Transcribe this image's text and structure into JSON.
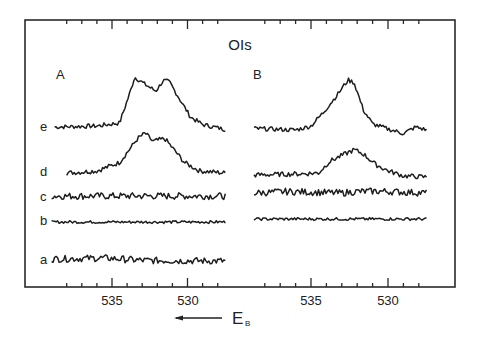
{
  "figure": {
    "title": "OIs",
    "x_axis_label": "E",
    "x_axis_label_subscript": "B",
    "x_axis_direction_note": "arrow pointing left (increasing binding energy)",
    "panels": [
      {
        "id": "A",
        "label": "A"
      },
      {
        "id": "B",
        "label": "B"
      }
    ],
    "curve_labels": [
      "e",
      "d",
      "c",
      "b",
      "a"
    ],
    "tick_labels": [
      "535",
      "530"
    ]
  },
  "colors": {
    "background": "#ffffff",
    "line": "#1e1e1e",
    "frame": "#2a2a2a"
  },
  "chart_data": [
    {
      "type": "line",
      "title": "OIs",
      "panel": "A",
      "xlabel": "E_B (binding energy, eV)",
      "ylabel": "",
      "xlim": [
        539,
        527.5
      ],
      "x_reversed": true,
      "x_ticks_major": [
        535,
        530
      ],
      "x_ticks_minor_step": 1,
      "grid": false,
      "legend": "none (curves labeled a-e at left)",
      "series": [
        {
          "name": "e",
          "baseline_y_px": 127,
          "x": [
            538.8,
            536,
            534.5,
            533.8,
            533.5,
            532.8,
            532.1,
            531.6,
            531.2,
            530.5,
            529.8,
            529,
            527.5
          ],
          "y": [
            0,
            0.02,
            0.08,
            0.7,
            1.0,
            0.85,
            0.72,
            0.93,
            0.9,
            0.55,
            0.2,
            0.05,
            -0.05
          ]
        },
        {
          "name": "d",
          "baseline_y_px": 173,
          "x": [
            538,
            536,
            534.5,
            533.3,
            532.8,
            532.3,
            531.5,
            531,
            530.2,
            529.2,
            527.5
          ],
          "y": [
            0,
            0.05,
            0.25,
            0.82,
            0.95,
            0.75,
            0.82,
            0.6,
            0.25,
            0.05,
            0
          ]
        },
        {
          "name": "c",
          "baseline_y_px": 196,
          "x": [
            539,
            527.5
          ],
          "y": [
            0,
            0
          ],
          "note": "noisy flat background"
        },
        {
          "name": "b",
          "baseline_y_px": 222,
          "x": [
            539,
            527.5
          ],
          "y": [
            0,
            0
          ],
          "note": "low-noise flat background"
        },
        {
          "name": "a",
          "baseline_y_px": 260,
          "x": [
            539,
            535.5,
            533,
            527.5
          ],
          "y": [
            0.05,
            0.1,
            -0.02,
            -0.05
          ],
          "note": "noisy, slightly higher on left"
        }
      ]
    },
    {
      "type": "line",
      "title": "OIs",
      "panel": "B",
      "xlabel": "E_B (binding energy, eV)",
      "ylabel": "",
      "xlim": [
        539,
        527.5
      ],
      "x_reversed": true,
      "x_ticks_major": [
        535,
        530
      ],
      "x_ticks_minor_step": 1,
      "grid": false,
      "legend": "none",
      "series": [
        {
          "name": "e",
          "baseline_y_px": 130,
          "x": [
            538.7,
            536,
            535,
            534.2,
            533.3,
            532.6,
            532.2,
            531.6,
            531,
            530,
            529,
            528.2,
            527.5
          ],
          "y": [
            0.03,
            0,
            0.08,
            0.35,
            0.7,
            1.0,
            0.95,
            0.4,
            0.12,
            0.02,
            -0.07,
            0.06,
            0
          ]
        },
        {
          "name": "d",
          "baseline_y_px": 175,
          "x": [
            538.7,
            535.5,
            534.5,
            533.8,
            532.8,
            532.2,
            531.6,
            530.8,
            530,
            529,
            527.5
          ],
          "y": [
            0,
            0.03,
            0.05,
            0.32,
            0.5,
            0.6,
            0.5,
            0.25,
            0.1,
            -0.02,
            -0.05
          ]
        },
        {
          "name": "c",
          "baseline_y_px": 193,
          "x": [
            538.7,
            536.5,
            533,
            532,
            530.5,
            527.5
          ],
          "y": [
            0,
            0.08,
            0.0,
            0.08,
            0.1,
            0.0
          ],
          "note": "noisy"
        },
        {
          "name": "b",
          "baseline_y_px": 219,
          "x": [
            538.7,
            527.5
          ],
          "y": [
            0,
            0
          ],
          "note": "low-noise flat"
        }
      ]
    }
  ]
}
